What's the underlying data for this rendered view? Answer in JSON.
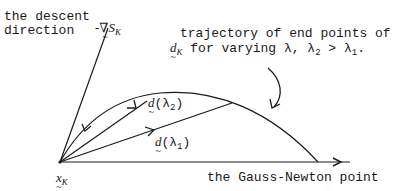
{
  "diagram": {
    "descent_label_line1": "the descent",
    "descent_label_line2": "direction",
    "gradient_label": "-∇S",
    "gradient_subscript": "K",
    "trajectory_line1": "trajectory of end points of",
    "trajectory_d": "d",
    "trajectory_d_sub": "K",
    "trajectory_line2": " for varying λ, λ",
    "trajectory_l2_sub": "2",
    "trajectory_gt": " > λ",
    "trajectory_l1_sub": "1",
    "trajectory_end": ".",
    "d_lambda2_d": "d",
    "d_lambda2_rest": "(λ",
    "d_lambda2_sub": "2",
    "d_lambda2_close": ")",
    "d_lambda1_d": "d",
    "d_lambda1_rest": "(λ",
    "d_lambda1_sub": "1",
    "d_lambda1_close": ")",
    "origin_label": "x",
    "origin_sub": "K",
    "gauss_newton_label": "the Gauss-Newton point"
  }
}
